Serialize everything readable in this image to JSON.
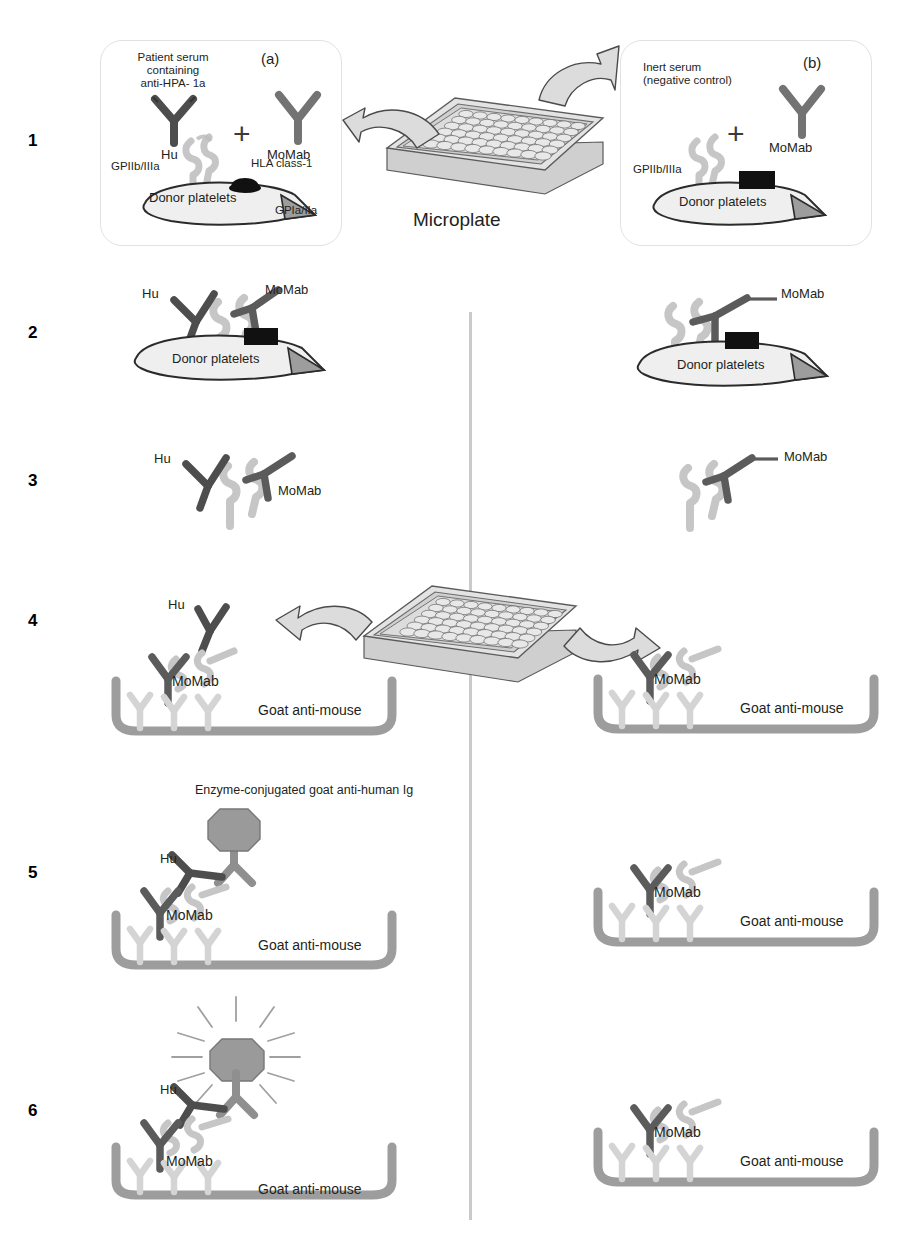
{
  "figure": {
    "type": "scientific-diagram",
    "width": 920,
    "height": 1246
  },
  "colors": {
    "human_antibody": "#4d4d4d",
    "mouse_antibody": "#6f6f6f",
    "glycoprotein": "#c8c8c8",
    "platelet_fill": "#efefef",
    "hla_black": "#111111",
    "well_gray": "#9d9d9d",
    "capture_antibody": "#d4d4d4",
    "enzyme_hex": "#9a9a9a",
    "plate_gray": "#c4c4c4",
    "panel_border": "#e2e2e4",
    "divider": "#c9cacc",
    "text": "#231f20"
  },
  "steps": [
    {
      "number": "1",
      "y": 140
    },
    {
      "number": "2",
      "y": 332
    },
    {
      "number": "3",
      "y": 480
    },
    {
      "number": "4",
      "y": 620
    },
    {
      "number": "5",
      "y": 872
    },
    {
      "number": "6",
      "y": 1110
    }
  ],
  "panel_a": {
    "tag": "(a)",
    "serum_label": "Patient serum\ncontaining\nanti-HPA- 1a",
    "serum_label_lines": [
      "Patient serum",
      "containing",
      "anti-HPA- 1a"
    ],
    "human_ab_label": "Hu",
    "mouse_ab_label": "MoMab",
    "plus": "+",
    "gp2b3a_label": "GPIIb/IIIa",
    "hla_label": "HLA class-1",
    "gp1a2a_label": "GPIa/IIa",
    "platelet_label": "Donor platelets"
  },
  "panel_b": {
    "tag": "(b)",
    "serum_label_lines": [
      "Inert serum",
      "(negative control)"
    ],
    "mouse_ab_label": "MoMab",
    "plus": "+",
    "gp2b3a_label": "GPIIb/IIIa",
    "platelet_label": "Donor platelets"
  },
  "microplate": {
    "caption": "Microplate",
    "rows": 8,
    "cols": 12
  },
  "step2": {
    "left": {
      "human_ab_label": "Hu",
      "mouse_ab_label": "MoMab",
      "platelet_label": "Donor platelets"
    },
    "right": {
      "mouse_ab_label": "MoMab",
      "platelet_label": "Donor platelets"
    }
  },
  "step3": {
    "left": {
      "human_ab_label": "Hu",
      "mouse_ab_label": "MoMab"
    },
    "right": {
      "mouse_ab_label": "MoMab"
    }
  },
  "step4": {
    "left": {
      "human_ab_label": "Hu",
      "mouse_ab_label": "MoMab",
      "coat_label": "Goat anti-mouse"
    },
    "right": {
      "mouse_ab_label": "MoMab",
      "coat_label": "Goat anti-mouse"
    }
  },
  "step5": {
    "left": {
      "conjugate_label": "Enzyme-conjugated goat anti-human Ig",
      "human_ab_label": "Hu",
      "mouse_ab_label": "MoMab",
      "coat_label": "Goat anti-mouse"
    },
    "right": {
      "mouse_ab_label": "MoMab",
      "coat_label": "Goat anti-mouse"
    }
  },
  "step6": {
    "left": {
      "human_ab_label": "Hu",
      "mouse_ab_label": "MoMab",
      "coat_label": "Goat anti-mouse",
      "signal": "glowing-enzyme"
    },
    "right": {
      "mouse_ab_label": "MoMab",
      "coat_label": "Goat anti-mouse"
    }
  }
}
